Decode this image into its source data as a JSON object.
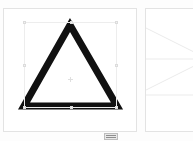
{
  "app": {
    "title": "Shape Canvas",
    "background_color": "#fdfdfd"
  },
  "panels": [
    {
      "id": "panel-left",
      "name": "Triangle Canvas",
      "label": "Triangle Canvas",
      "background_color": "#ffffff",
      "border_color": "#e3e3e3",
      "shape": {
        "type": "triangle",
        "name": "Triangle",
        "stroke_color": "#111111",
        "fill_color": "none",
        "stroke_width": 7
      },
      "selection": {
        "visible": true,
        "box_color": "#ededed",
        "handle_fill": "#f2f2f2",
        "handle_border": "#dcdcdc",
        "handle_count": 8,
        "center_marker": true
      }
    },
    {
      "id": "panel-right",
      "name": "Zoomed Detail Canvas",
      "label": "Zoomed Detail Canvas",
      "background_color": "#ffffff",
      "border_color": "#e3e3e3",
      "shape": {
        "type": "triangle",
        "name": "Triangle Apex Detail",
        "stroke_color": "#111111",
        "fill_color": "none",
        "stroke_width": 6
      },
      "guides": {
        "visible": true,
        "color": "#ebebeb",
        "stroke_width": 1
      }
    }
  ],
  "bottom_widget": {
    "name": "status-widget",
    "label": "",
    "fill_color": "#e8e8e8",
    "border_color": "#bdbdbd",
    "bar_color": "#8e8e8e"
  }
}
